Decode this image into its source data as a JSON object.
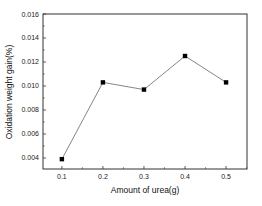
{
  "chart_data": {
    "type": "line",
    "title": "",
    "xlabel": "Amount of urea(g)",
    "ylabel": "Oxidation weight gain(%)",
    "x": [
      0.1,
      0.2,
      0.3,
      0.4,
      0.5
    ],
    "series": [
      {
        "name": "Oxidation weight gain",
        "values": [
          0.0039,
          0.0103,
          0.0097,
          0.0125,
          0.0103
        ],
        "marker": "square",
        "color": "#000000",
        "line_color": "#555555"
      }
    ],
    "xticks": [
      "0.1",
      "0.2",
      "0.3",
      "0.4",
      "0.5"
    ],
    "yticks": [
      "0.004",
      "0.006",
      "0.008",
      "0.010",
      "0.012",
      "0.014",
      "0.016"
    ],
    "xlim": [
      0.054,
      0.551
    ],
    "ylim": [
      0.00308,
      0.016
    ],
    "grid": false,
    "legend": null
  }
}
